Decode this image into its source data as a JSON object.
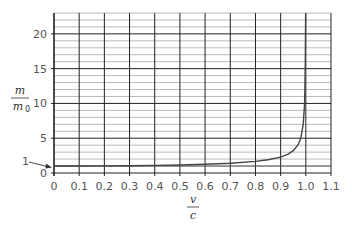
{
  "chart_data": {
    "type": "line",
    "title": "",
    "xlabel": "v/c",
    "ylabel": "m/m0",
    "xlim": [
      0,
      1.1
    ],
    "ylim": [
      0,
      23
    ],
    "grid": {
      "major": true,
      "minor_y": true
    },
    "x_ticks": [
      "0",
      "0.1",
      "0.2",
      "0.3",
      "0.4",
      "0.5",
      "0.6",
      "0.7",
      "0.8",
      "0.9",
      "1.0",
      "1.1"
    ],
    "y_ticks": [
      "0",
      "5",
      "10",
      "15",
      "20"
    ],
    "annotations": [
      {
        "text": "1",
        "points_to": [
          0,
          1
        ]
      }
    ],
    "series": [
      {
        "name": "m/m0 = 1/sqrt(1-(v/c)^2)",
        "x": [
          0,
          0.1,
          0.2,
          0.3,
          0.4,
          0.5,
          0.6,
          0.7,
          0.8,
          0.85,
          0.9,
          0.93,
          0.95,
          0.97,
          0.98,
          0.99,
          0.995,
          0.998,
          0.999
        ],
        "values": [
          1.0,
          1.01,
          1.02,
          1.05,
          1.09,
          1.15,
          1.25,
          1.4,
          1.67,
          1.9,
          2.29,
          2.72,
          3.2,
          4.11,
          5.03,
          7.09,
          10.01,
          15.82,
          22.37
        ]
      }
    ],
    "asymptote_x": 1.0,
    "colors": {
      "grid_major": "#222222",
      "grid_minor": "#aaaaaa",
      "curve": "#444444"
    }
  },
  "labels": {
    "y_num": "m",
    "y_den": "m",
    "y_den_sub": "0",
    "x_num": "v",
    "x_den": "c",
    "annotation_one": "1"
  }
}
